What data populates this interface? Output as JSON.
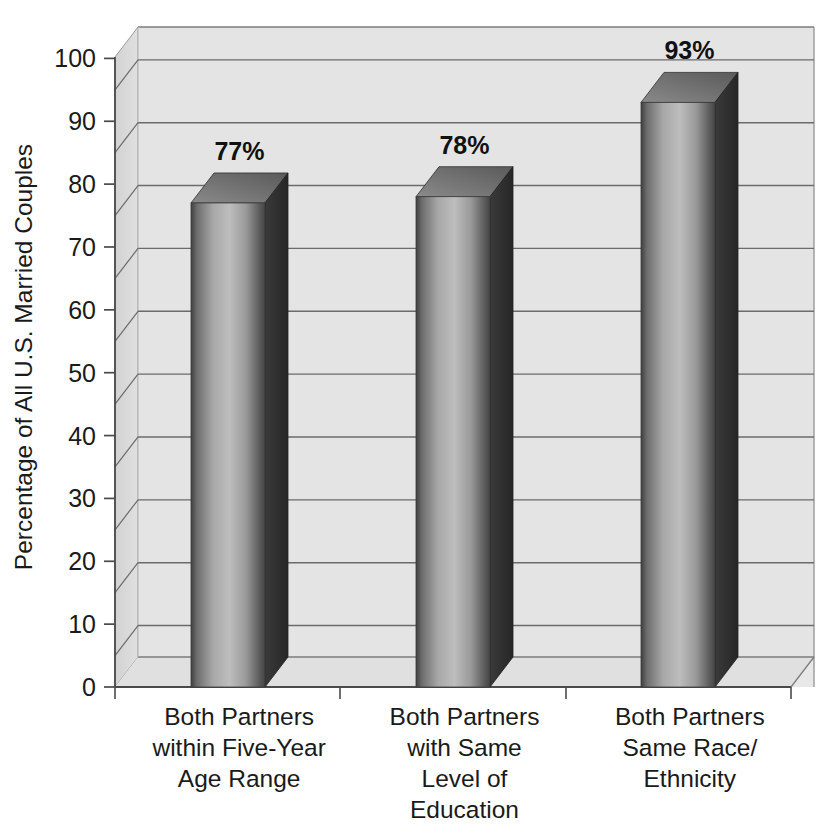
{
  "chart_data": {
    "type": "bar",
    "title": "",
    "subtitle": "",
    "xlabel": "",
    "ylabel": "Percentage of All U.S. Married Couples",
    "ylim": [
      0,
      105
    ],
    "ytick_labels": [
      "0",
      "10",
      "20",
      "30",
      "40",
      "50",
      "60",
      "70",
      "80",
      "90",
      "100"
    ],
    "ytick_values": [
      0,
      10,
      20,
      30,
      40,
      50,
      60,
      70,
      80,
      90,
      100
    ],
    "gridlines": true,
    "gridline_values": [
      5,
      15,
      25,
      35,
      45,
      55,
      65,
      75,
      85,
      95,
      105
    ],
    "legend": null,
    "three_d": true,
    "categories": [
      "Both Partners\nwithin Five-Year\nAge Range",
      "Both Partners\nwith Same\nLevel of\nEducation",
      "Both Partners\nSame Race/\nEthnicity"
    ],
    "category_lines": [
      [
        "Both Partners",
        "within Five-Year",
        "Age Range"
      ],
      [
        "Both Partners",
        "with Same",
        "Level of",
        "Education"
      ],
      [
        "Both Partners",
        "Same Race/",
        "Ethnicity"
      ]
    ],
    "values": [
      77,
      78,
      93
    ],
    "value_labels": [
      "77%",
      "78%",
      "93%"
    ]
  },
  "colors": {
    "plot_background": "#e4e4e4",
    "wall_side": "#dcdcdc",
    "gridline": "#6b6b6b",
    "axis_line": "#4a4a4a",
    "bar_front_light": "#b9b9b9",
    "bar_front_dark": "#4d4d4d",
    "bar_side": "#3a3a3a",
    "bar_top": "#6e6e6e",
    "text": "#1a1a1a",
    "page_background": "#ffffff"
  },
  "geometry": {
    "plot_left": 115,
    "plot_right": 814,
    "baseline_y": 687,
    "top_y": 27,
    "depth_x": 23,
    "depth_y": 30,
    "px_per_unit": 6.286
  }
}
